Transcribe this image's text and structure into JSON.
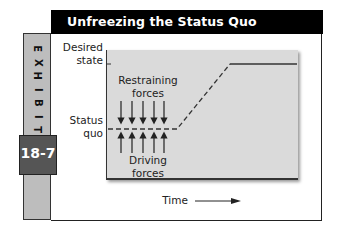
{
  "title": "Unfreezing the Status Quo",
  "exhibit": {
    "label_letters": [
      "E",
      "X",
      "H",
      "I",
      "B",
      "I",
      "T"
    ],
    "number": "18-7"
  },
  "diagram": {
    "y_labels": {
      "desired_line1": "Desired",
      "desired_line2": "state",
      "status_line1": "Status",
      "status_line2": "quo"
    },
    "restraining": {
      "line1": "Restraining",
      "line2": "forces",
      "arrow_count": 5,
      "direction": "down"
    },
    "driving": {
      "line1": "Driving",
      "line2": "forces",
      "arrow_count": 5,
      "direction": "up"
    },
    "x_label": "Time",
    "lines": {
      "status_quo": "dashed horizontal, then dashed rise",
      "desired_state": "solid horizontal"
    },
    "colors": {
      "panel": "#dadada",
      "band": "#bdbdbd",
      "number_box": "#555555",
      "title_bar": "#000000"
    }
  }
}
